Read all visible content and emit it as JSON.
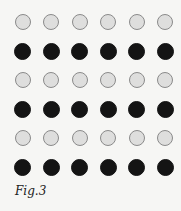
{
  "figure": {
    "caption": "Fig.3",
    "grid": {
      "columns": 6,
      "rows": [
        "light",
        "dark",
        "light",
        "dark",
        "light",
        "dark"
      ],
      "col_centers": [
        22.5,
        51,
        79.5,
        108,
        136.5,
        165
      ],
      "row_centers": [
        22,
        51,
        80,
        109,
        138,
        167
      ]
    },
    "colors": {
      "light_fill": "#dededd",
      "light_stroke": "#8a8a8a",
      "dark_fill": "#141414",
      "background": "#f6f6f4"
    }
  }
}
